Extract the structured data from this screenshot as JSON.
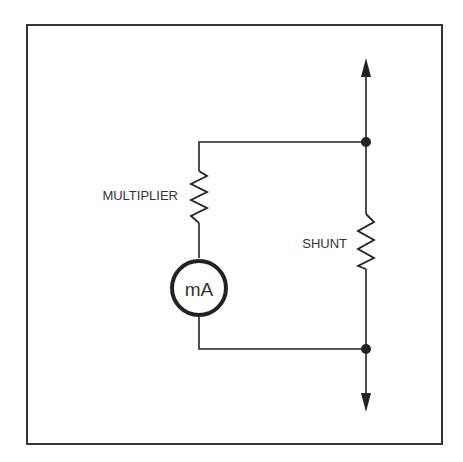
{
  "diagram": {
    "labels": {
      "multiplier": "MULTIPLIER",
      "shunt": "SHUNT",
      "meter": "mA"
    },
    "components": [
      {
        "type": "resistor",
        "name": "multiplier",
        "branch": "left"
      },
      {
        "type": "meter",
        "name": "milliammeter",
        "unit": "mA",
        "branch": "left"
      },
      {
        "type": "resistor",
        "name": "shunt",
        "branch": "right"
      },
      {
        "type": "junction",
        "position": "top"
      },
      {
        "type": "junction",
        "position": "bottom"
      },
      {
        "type": "arrow",
        "direction": "up"
      },
      {
        "type": "arrow",
        "direction": "down"
      }
    ],
    "colors": {
      "line": "#222222",
      "background": "#ffffff"
    }
  }
}
